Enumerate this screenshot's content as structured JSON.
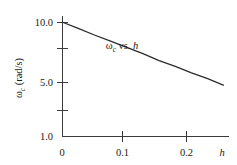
{
  "chart_data": {
    "type": "line",
    "title": "",
    "subtitle": "",
    "xlabel": "h",
    "ylabel": "ωc (rad/s)",
    "yscale": "log",
    "xscale": "linear",
    "grid": false,
    "legend": "none",
    "xlim": [
      0,
      0.26
    ],
    "ylim": [
      1.0,
      11.0
    ],
    "xticks": [
      0,
      0.1,
      0.2
    ],
    "xtick_labels": [
      "0",
      "0.1",
      "0.2"
    ],
    "yticks": [
      1.0,
      2.5,
      5.0,
      7.5,
      10.0
    ],
    "ytick_labels": [
      "1.0",
      "",
      "5.0",
      "",
      "10.0"
    ],
    "ytick_labels_major": [
      "10.0",
      "5.0",
      "1.0"
    ],
    "series": [
      {
        "name": "ωc vs. h",
        "x": [
          0.0,
          0.026,
          0.052,
          0.078,
          0.104,
          0.13,
          0.156,
          0.182,
          0.208,
          0.234,
          0.26
        ],
        "values": [
          10.0,
          8.8,
          7.7,
          6.8,
          6.0,
          5.3,
          4.6,
          4.1,
          3.6,
          3.2,
          2.8
        ]
      }
    ],
    "annotations": [
      {
        "text": "ωc vs. h",
        "symbol": "ω",
        "subscript": "c",
        "rest": " vs. ",
        "italic_var": "h",
        "x": 0.115,
        "y": 7.3
      }
    ]
  },
  "axes": {
    "y": {
      "symbol": "ω",
      "subscript": "c",
      "unit": "(rad/s)"
    },
    "x": {
      "symbol": "h"
    }
  },
  "colors": {
    "background": "#ffffff",
    "axis": "#3c3c3c",
    "line": "#2b2b2b",
    "text": "#1a1a1a"
  }
}
